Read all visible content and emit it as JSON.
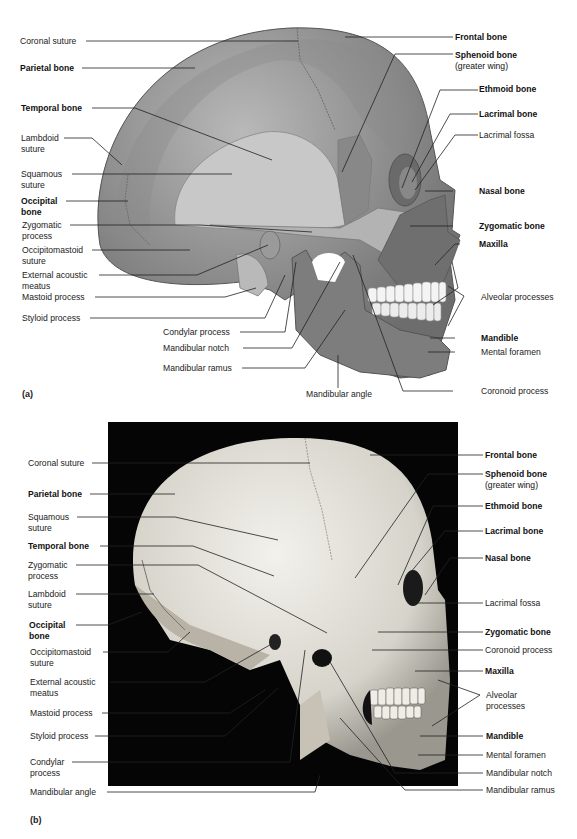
{
  "figure": {
    "panel_a": {
      "letter": "(a)",
      "type": "illustration",
      "labels_left": [
        {
          "text": "Coronal suture",
          "bold": false
        },
        {
          "text": "Parietal bone",
          "bold": true
        },
        {
          "text": "Temporal bone",
          "bold": true
        },
        {
          "text": "Lambdoid",
          "line2": "suture",
          "bold": false
        },
        {
          "text": "Squamous",
          "line2": "suture",
          "bold": false
        },
        {
          "text": "Occipital",
          "line2": "bone",
          "bold": true
        },
        {
          "text": "Zygomatic",
          "line2": "process",
          "bold": false
        },
        {
          "text": "Occipitomastoid",
          "line2": "suture",
          "bold": false
        },
        {
          "text": "External acoustic",
          "line2": "meatus",
          "bold": false
        },
        {
          "text": "Mastoid process",
          "bold": false
        },
        {
          "text": "Styloid process",
          "bold": false
        }
      ],
      "labels_bottom": [
        {
          "text": "Condylar process",
          "bold": false
        },
        {
          "text": "Mandibular notch",
          "bold": false
        },
        {
          "text": "Mandibular ramus",
          "bold": false
        },
        {
          "text": "Mandibular angle",
          "bold": false
        }
      ],
      "labels_right": [
        {
          "text": "Frontal bone",
          "bold": true
        },
        {
          "text": "Sphenoid bone",
          "line2": "(greater wing)",
          "bold": true
        },
        {
          "text": "Ethmoid bone",
          "bold": true
        },
        {
          "text": "Lacrimal bone",
          "bold": true
        },
        {
          "text": "Lacrimal fossa",
          "bold": false
        },
        {
          "text": "Nasal bone",
          "bold": true
        },
        {
          "text": "Zygomatic bone",
          "bold": true
        },
        {
          "text": "Maxilla",
          "bold": true
        },
        {
          "text": "Alveolar processes",
          "bold": false
        },
        {
          "text": "Mandible",
          "bold": true
        },
        {
          "text": "Mental foramen",
          "bold": false
        },
        {
          "text": "Coronoid process",
          "bold": false
        }
      ]
    },
    "panel_b": {
      "letter": "(b)",
      "type": "photograph",
      "labels_left": [
        {
          "text": "Coronal suture",
          "bold": false
        },
        {
          "text": "Parietal bone",
          "bold": true
        },
        {
          "text": "Squamous",
          "line2": "suture",
          "bold": false
        },
        {
          "text": "Temporal bone",
          "bold": true
        },
        {
          "text": "Zygomatic",
          "line2": "process",
          "bold": false
        },
        {
          "text": "Lambdoid",
          "line2": "suture",
          "bold": false
        },
        {
          "text": "Occipital",
          "line2": "bone",
          "bold": true
        },
        {
          "text": "Occipitomastoid",
          "line2": "suture",
          "bold": false
        },
        {
          "text": "External acoustic",
          "line2": "meatus",
          "bold": false
        },
        {
          "text": "Mastoid process",
          "bold": false
        },
        {
          "text": "Styloid process",
          "bold": false
        },
        {
          "text": "Condylar",
          "line2": "process",
          "bold": false
        },
        {
          "text": "Mandibular angle",
          "bold": false
        }
      ],
      "labels_right": [
        {
          "text": "Frontal bone",
          "bold": true
        },
        {
          "text": "Sphenoid bone",
          "line2": "(greater wing)",
          "bold": true
        },
        {
          "text": "Ethmoid bone",
          "bold": true
        },
        {
          "text": "Lacrimal bone",
          "bold": true
        },
        {
          "text": "Nasal bone",
          "bold": true
        },
        {
          "text": "Lacrimal fossa",
          "bold": false
        },
        {
          "text": "Zygomatic bone",
          "bold": true
        },
        {
          "text": "Coronoid process",
          "bold": false
        },
        {
          "text": "Maxilla",
          "bold": true
        },
        {
          "text": "Alveolar",
          "line2": "processes",
          "bold": false
        },
        {
          "text": "Mandible",
          "bold": true
        },
        {
          "text": "Mental foramen",
          "bold": false
        },
        {
          "text": "Mandibular notch",
          "bold": false
        },
        {
          "text": "Mandibular ramus",
          "bold": false
        }
      ]
    }
  }
}
